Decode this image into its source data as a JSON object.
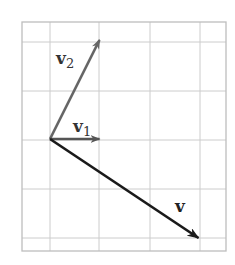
{
  "diagram": {
    "type": "vector-plot",
    "grid": {
      "frame": {
        "x0": 22,
        "y0": 22,
        "x1": 226,
        "y1": 251
      },
      "vertical_lines": [
        50,
        99,
        150,
        200
      ],
      "horizontal_lines": [
        42,
        91,
        140,
        189,
        238
      ],
      "line_color": "#cccccc",
      "frame_color": "#bdbdbd"
    },
    "origin": {
      "x": 50,
      "y": 139
    },
    "unit_px": 49.5,
    "vectors": [
      {
        "name": "v1",
        "label": "v",
        "subscript": "1",
        "components": [
          1,
          0
        ],
        "color": "#555555",
        "label_pos": {
          "x": 73,
          "y": 132
        }
      },
      {
        "name": "v2",
        "label": "v",
        "subscript": "2",
        "components": [
          1,
          2
        ],
        "color": "#666666",
        "label_pos": {
          "x": 56,
          "y": 64
        }
      },
      {
        "name": "v",
        "label": "v",
        "subscript": "",
        "components": [
          3,
          -2
        ],
        "color": "#1a1a1a",
        "label_pos": {
          "x": 175,
          "y": 212
        }
      }
    ]
  }
}
